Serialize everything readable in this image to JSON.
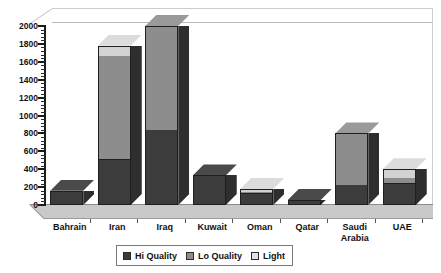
{
  "chart_data": {
    "type": "bar",
    "subtype": "stacked-3d-column",
    "title": "",
    "xlabel": "",
    "ylabel": "",
    "ylim": [
      0,
      2000
    ],
    "ytick_step": 200,
    "yticks": [
      "0",
      "200",
      "400",
      "600",
      "800",
      "1000",
      "1200",
      "1400",
      "1600",
      "1800",
      "2000"
    ],
    "grid": false,
    "legend_position": "bottom",
    "categories": [
      "Bahrain",
      "Iran",
      "Iraq",
      "Kuwait",
      "Oman",
      "Qatar",
      "Saudi Arabia",
      "UAE"
    ],
    "series": [
      {
        "name": "Hi Quality",
        "color": "#3c3c3c",
        "values": [
          160,
          500,
          840,
          330,
          120,
          55,
          220,
          230
        ]
      },
      {
        "name": "Lo Quality",
        "color": "#8d8d8d",
        "values": [
          0,
          1160,
          1160,
          0,
          25,
          0,
          580,
          75
        ]
      },
      {
        "name": "Light",
        "color": "#d2d2d2",
        "values": [
          0,
          120,
          0,
          0,
          35,
          0,
          0,
          95
        ]
      }
    ],
    "totals": [
      160,
      1780,
      2000,
      330,
      180,
      55,
      800,
      400
    ]
  },
  "legend": {
    "items": [
      {
        "label": "Hi Quality",
        "swatch": "hi"
      },
      {
        "label": "Lo Quality",
        "swatch": "lo"
      },
      {
        "label": "Light",
        "swatch": "lt"
      }
    ]
  },
  "colors": {
    "hi_quality": "#3c3c3c",
    "lo_quality": "#8d8d8d",
    "light": "#d2d2d2",
    "floor": "#c9c9c9",
    "wall": "#ffffff",
    "axis": "#1a1a1a",
    "background": "#ffffff"
  }
}
